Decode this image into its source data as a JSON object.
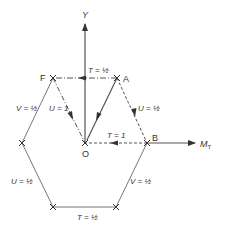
{
  "axes": {
    "y_label": "Y",
    "x_label": "M",
    "x_subscript": "T"
  },
  "points": {
    "A": "A",
    "B": "B",
    "F": "F",
    "O": "O"
  },
  "edge_labels": {
    "top": "T = ½",
    "right_upper": "U = ½",
    "left_upper": "V = ½",
    "left_lower": "U = ½",
    "right_lower": "V = ½",
    "bottom": "T = ½",
    "f_to_o": "U = 1",
    "b_to_o": "T = 1"
  },
  "colors": {
    "line": "#555555",
    "text": "#333333"
  }
}
